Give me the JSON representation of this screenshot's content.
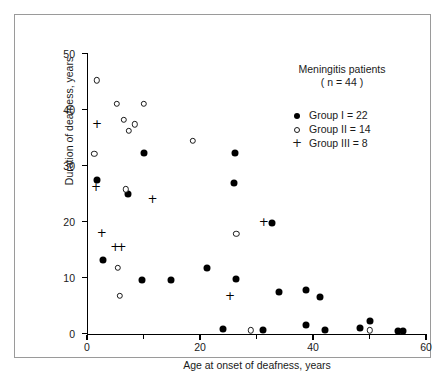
{
  "chart_data": {
    "type": "scatter",
    "title": "",
    "annotation_title": "Meningitis patients",
    "annotation_subtitle": "( n = 44 )",
    "xlabel": "Age at onset of deafness, years",
    "ylabel": "Duration of deafness, years",
    "xlim": [
      0,
      60
    ],
    "ylim": [
      0,
      50
    ],
    "xticks": [
      0,
      20,
      40,
      60
    ],
    "xticks_labels": [
      "0",
      "20",
      "40",
      "60"
    ],
    "xminor_ticks": [
      10,
      30,
      50
    ],
    "yticks": [
      0,
      10,
      20,
      30,
      40,
      50
    ],
    "yticks_labels": [
      "0",
      "10",
      "20",
      "30",
      "40",
      "50"
    ],
    "grid": false,
    "legend_position": "upper-right",
    "series": [
      {
        "name": "Group I = 22",
        "marker": "filled-circle",
        "count": 22,
        "color": "#000000",
        "points": [
          [
            1.8,
            27.4
          ],
          [
            2.8,
            13.1
          ],
          [
            7.3,
            24.9
          ],
          [
            10.0,
            32.2
          ],
          [
            9.8,
            9.6
          ],
          [
            14.8,
            9.6
          ],
          [
            21.2,
            11.7
          ],
          [
            26.2,
            32.2
          ],
          [
            26.1,
            26.9
          ],
          [
            26.3,
            9.7
          ],
          [
            24.1,
            0.8
          ],
          [
            31.2,
            0.6
          ],
          [
            32.8,
            19.8
          ],
          [
            34.0,
            7.5
          ],
          [
            38.7,
            7.7
          ],
          [
            38.8,
            1.5
          ],
          [
            41.2,
            6.6
          ],
          [
            42.2,
            0.6
          ],
          [
            48.3,
            1.0
          ],
          [
            50.1,
            2.3
          ],
          [
            55.0,
            0.5
          ],
          [
            56.0,
            0.5
          ]
        ]
      },
      {
        "name": "Group II = 14",
        "marker": "open-circle",
        "count": 14,
        "color": "#1a1a1a",
        "points": [
          [
            1.7,
            45.2
          ],
          [
            1.3,
            32.1
          ],
          [
            5.3,
            41.0
          ],
          [
            6.5,
            38.2
          ],
          [
            7.4,
            36.2
          ],
          [
            8.5,
            37.4
          ],
          [
            10.0,
            41.0
          ],
          [
            6.9,
            25.8
          ],
          [
            5.4,
            11.8
          ],
          [
            5.8,
            6.7
          ],
          [
            18.7,
            34.4
          ],
          [
            26.4,
            17.8
          ],
          [
            29.0,
            0.6
          ],
          [
            50.0,
            0.6
          ]
        ]
      },
      {
        "name": "Group III = 8",
        "marker": "plus",
        "count": 8,
        "color": "#000000",
        "points": [
          [
            1.7,
            37.4
          ],
          [
            1.5,
            26.2
          ],
          [
            11.5,
            24.0
          ],
          [
            2.5,
            18.0
          ],
          [
            4.9,
            15.5
          ],
          [
            6.0,
            15.5
          ],
          [
            25.2,
            6.8
          ],
          [
            31.2,
            19.9
          ]
        ]
      }
    ]
  },
  "legend": {
    "title": "Meningitis patients",
    "subtitle": "( n = 44 )",
    "entries": [
      {
        "key": "filled-circle",
        "label": "Group I = 22"
      },
      {
        "key": "open-circle",
        "label": "Group II = 14"
      },
      {
        "key": "plus",
        "label": "Group III = 8"
      }
    ]
  }
}
